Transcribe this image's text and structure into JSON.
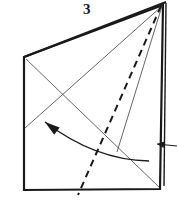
{
  "figure": {
    "type": "origami-fold-diagram",
    "step_number": "3",
    "step_label_position": {
      "x": 83,
      "y": 2
    },
    "canvas": {
      "width": 177,
      "height": 208
    },
    "background_color": "#ffffff",
    "ink_color": "#1a1a1a",
    "thin_line_color": "#555555",
    "outline": {
      "name": "paper-outline",
      "description": "quadrilateral sheet of paper, top-right corner raised",
      "points": [
        {
          "name": "top-left",
          "x": 24,
          "y": 57
        },
        {
          "name": "apex-top-right",
          "x": 163,
          "y": 5
        },
        {
          "name": "bottom-right",
          "x": 160,
          "y": 189
        },
        {
          "name": "bottom-left",
          "x": 24,
          "y": 190
        }
      ],
      "stroke_width": 2.2
    },
    "folded_edge": {
      "name": "folded-top-edge",
      "description": "doubled top edge showing layered paper",
      "from": {
        "x": 24,
        "y": 57
      },
      "to": {
        "x": 166,
        "y": 2
      },
      "offset": 3.0
    },
    "right_flap_edge": {
      "name": "right-flap-edge",
      "description": "thin second layer along right side",
      "from": {
        "x": 166,
        "y": 3
      },
      "to": {
        "x": 164,
        "y": 186
      }
    },
    "crease_lines": [
      {
        "name": "crease-apex-to-bottom-left",
        "style": "thin-solid",
        "from": {
          "x": 162,
          "y": 6
        },
        "to": {
          "x": 25,
          "y": 128
        }
      },
      {
        "name": "crease-top-left-to-bottom-right",
        "style": "thin-solid",
        "from": {
          "x": 26,
          "y": 59
        },
        "to": {
          "x": 159,
          "y": 187
        }
      },
      {
        "name": "crease-apex-to-bottom-mid",
        "style": "thin-solid",
        "from": {
          "x": 162,
          "y": 6
        },
        "to": {
          "x": 117,
          "y": 152
        }
      }
    ],
    "dashed_fold_line": {
      "name": "valley-fold-dashed-line",
      "style": "dashed",
      "from": {
        "x": 161,
        "y": 6
      },
      "to": {
        "x": 78,
        "y": 195
      },
      "dash_pattern": "7 5",
      "stroke_width": 2.0
    },
    "fold_arrow": {
      "name": "fold-direction-arrow",
      "description": "curved arrow pointing up-left indicating fold motion",
      "tip": {
        "x": 45,
        "y": 122
      },
      "tail": {
        "x": 149,
        "y": 161
      },
      "control": {
        "x": 95,
        "y": 160
      }
    },
    "edge_arrow": {
      "name": "right-edge-inset-arrow",
      "description": "small left-pointing arrow at right edge",
      "tip": {
        "x": 157,
        "y": 144
      },
      "tail": {
        "x": 177,
        "y": 146
      }
    }
  }
}
